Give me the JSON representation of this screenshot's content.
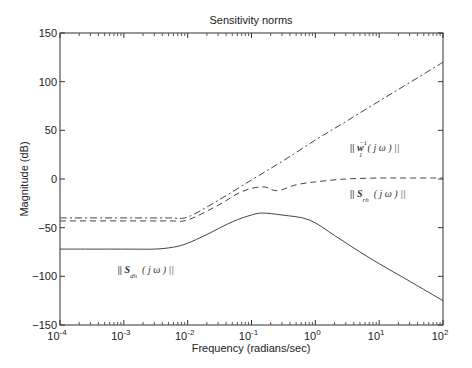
{
  "chart_data": {
    "type": "line",
    "title": "Sensitivity norms",
    "xlabel": "Frequency (radians/sec)",
    "ylabel": "Magnitude (dB)",
    "xscale": "log",
    "xlim": [
      0.0001,
      100
    ],
    "ylim": [
      -150,
      150
    ],
    "xticks": [
      "10^-4",
      "10^-3",
      "10^-2",
      "10^-1",
      "10^0",
      "10^1",
      "10^2"
    ],
    "yticks": [
      150,
      100,
      50,
      0,
      -50,
      -100,
      -150
    ],
    "grid": false,
    "legend": null,
    "series": [
      {
        "name": "|| w1^-1 (j ω) ||",
        "style": "dash-dot",
        "x": [
          0.0001,
          0.001,
          0.005,
          0.01,
          0.03,
          0.1,
          0.3,
          1,
          3,
          10,
          30,
          100
        ],
        "y": [
          -40,
          -40,
          -40,
          -39,
          -22,
          -1,
          18,
          40,
          59,
          80,
          99,
          120
        ]
      },
      {
        "name": "|| S_rh (j ω) ||",
        "style": "dashed",
        "x": [
          0.0001,
          0.001,
          0.005,
          0.01,
          0.03,
          0.07,
          0.15,
          0.25,
          0.5,
          1,
          3,
          10,
          30,
          100
        ],
        "y": [
          -43,
          -43,
          -43,
          -42,
          -27,
          -13,
          -8,
          -12,
          -6,
          -3,
          0,
          1,
          1,
          1
        ]
      },
      {
        "name": "|| S_dh (j ω) ||",
        "style": "solid",
        "x": [
          0.0001,
          0.001,
          0.003,
          0.006,
          0.01,
          0.02,
          0.05,
          0.1,
          0.15,
          0.3,
          0.8,
          2,
          5,
          10,
          30,
          100
        ],
        "y": [
          -72,
          -72,
          -72,
          -70,
          -66,
          -57,
          -44,
          -37,
          -35,
          -37,
          -42,
          -58,
          -75,
          -87,
          -105,
          -125
        ]
      }
    ],
    "annotations": [
      {
        "text_main": "|| w",
        "sub": "1",
        "sup": "−1",
        "rest": "( j ω ) ||",
        "x": 3.5,
        "y": 29
      },
      {
        "text_main": "|| S",
        "sub": "rh",
        "rest": "( j ω ) ||",
        "x": 3.5,
        "y": -18
      },
      {
        "text_main": "|| S",
        "sub": "dh",
        "rest": "( j ω ) ||",
        "x": 0.0008,
        "y": -97
      }
    ]
  }
}
